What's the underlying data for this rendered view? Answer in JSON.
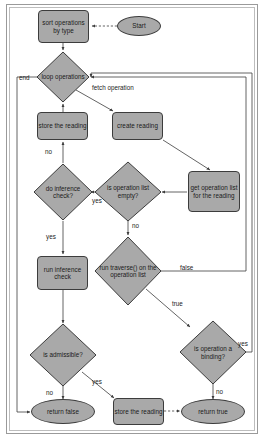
{
  "diagram": {
    "style": {
      "node_fill": "#a9a9a9",
      "node_stroke": "#3c3c3c",
      "line_color": "#3c3c3c",
      "background": "#ffffff",
      "frame_outer": "#9a9a9a",
      "frame_inner": "#bdbdbd"
    },
    "nodes": [
      {
        "id": "start",
        "shape": "ellipse",
        "label": "Start"
      },
      {
        "id": "sort_operations",
        "shape": "process",
        "label": "sort operations by type"
      },
      {
        "id": "loop_operations",
        "shape": "decision",
        "label": "loop operations"
      },
      {
        "id": "create_reading",
        "shape": "process",
        "label": "create reading"
      },
      {
        "id": "get_operation_list",
        "shape": "process",
        "label": "get operation list for the reading"
      },
      {
        "id": "store_reading_top",
        "shape": "process",
        "label": "store the reading"
      },
      {
        "id": "is_list_empty",
        "shape": "decision",
        "label": "is operation list empty?"
      },
      {
        "id": "do_inference_check",
        "shape": "decision",
        "label": "do inference check?"
      },
      {
        "id": "run_traverse",
        "shape": "decision",
        "label": "run traverse() on the operation list"
      },
      {
        "id": "run_inference_check",
        "shape": "process",
        "label": "run inference check"
      },
      {
        "id": "is_admissible",
        "shape": "decision",
        "label": "is admissible?"
      },
      {
        "id": "is_binding",
        "shape": "decision",
        "label": "is operation a binding?"
      },
      {
        "id": "return_false",
        "shape": "ellipse",
        "label": "return false"
      },
      {
        "id": "store_reading_bottom",
        "shape": "process",
        "label": "store the reading"
      },
      {
        "id": "return_true",
        "shape": "ellipse",
        "label": "return true"
      }
    ],
    "edge_labels": {
      "loop_end": "end",
      "fetch_operation": "fetch operation",
      "inference_no": "no",
      "empty_yes": "yes",
      "empty_no": "no",
      "inference_yes": "yes",
      "traverse_false": "false",
      "traverse_true": "true",
      "admissible_no": "no",
      "admissible_yes": "yes",
      "binding_yes": "yes",
      "binding_no": "no"
    }
  }
}
